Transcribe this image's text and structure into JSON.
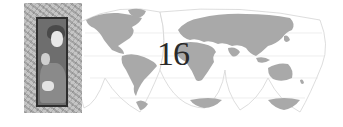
{
  "header": {
    "chapter_number": "16"
  },
  "illustration": {
    "map": {
      "type": "interrupted world map",
      "land_color": "#a9a9a9",
      "ocean_color": "#ffffff",
      "outline_color": "#cfcfcf"
    },
    "photo": {
      "subject": "mother and child portrait",
      "frame_style": "distressed grayscale frame"
    }
  }
}
